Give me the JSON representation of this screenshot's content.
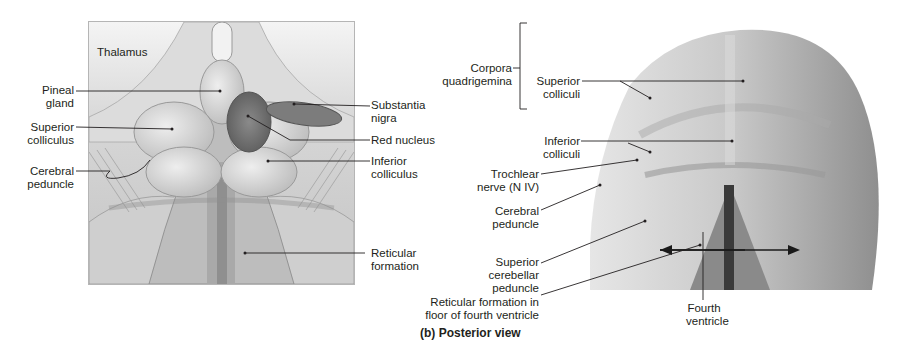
{
  "figure": {
    "caption": "(b) Posterior view",
    "colors": {
      "text": "#231f20",
      "leader": "#231f20",
      "box_border": "#b5b5b5"
    }
  },
  "illustration": {
    "corner_label": "Thalamus",
    "left_labels": [
      {
        "line1": "Pineal",
        "line2": "gland"
      },
      {
        "line1": "Superior",
        "line2": "colliculus"
      },
      {
        "line1": "Cerebral",
        "line2": "peduncle"
      }
    ],
    "right_labels": [
      {
        "line1": "Substantia",
        "line2": "nigra"
      },
      {
        "line1": "Red nucleus",
        "line2": ""
      },
      {
        "line1": "Inferior",
        "line2": "colliculus"
      },
      {
        "line1": "Reticular",
        "line2": "formation"
      }
    ]
  },
  "photo": {
    "bracket_group": {
      "line1": "Corpora",
      "line2": "quadrigemina"
    },
    "bracket_items": [
      {
        "line1": "Superior",
        "line2": "colliculi"
      },
      {
        "line1": "Inferior",
        "line2": "colliculi"
      }
    ],
    "left_labels": [
      {
        "line1": "Trochlear",
        "line2": "nerve (N IV)"
      },
      {
        "line1": "Cerebral",
        "line2": "peduncle"
      },
      {
        "line1": "Superior",
        "line2": "cerebellar",
        "line3": "peduncle"
      },
      {
        "line1": "Reticular formation in",
        "line2": "floor of fourth ventricle"
      }
    ],
    "bottom_label": {
      "line1": "Fourth",
      "line2": "ventricle"
    }
  }
}
